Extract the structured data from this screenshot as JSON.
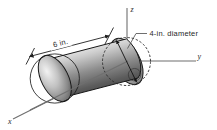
{
  "figure": {
    "type": "engineering-diagram",
    "background_color": "#ffffff",
    "axes": {
      "x_label": "x",
      "y_label": "y",
      "z_label": "z",
      "axis_color": "#6f6f6f"
    },
    "dimensions": {
      "length_label": "6 in.",
      "diameter_label": "4-in. diameter"
    },
    "solid": {
      "shading_light": "#e8e8e8",
      "shading_mid": "#9a9a9a",
      "shading_dark": "#3c3c3c",
      "outline_color": "#171717"
    }
  }
}
